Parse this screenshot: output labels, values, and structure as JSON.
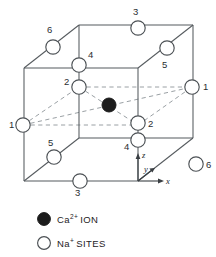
{
  "figure": {
    "colors": {
      "edge": "#555a5e",
      "hidden_edge": "#9aa0a4",
      "site_fill": "#ffffff",
      "site_stroke": "#4c5155",
      "ion_fill": "#1c1c1c",
      "background": "#ffffff"
    }
  },
  "nodes": [
    {
      "id": "site-6-top",
      "label": "6",
      "cx": 53,
      "cy": 47,
      "r": 7.2,
      "label_x": 47,
      "label_y": 33
    },
    {
      "id": "site-3-top",
      "label": "3",
      "cx": 138,
      "cy": 28,
      "r": 7.2,
      "label_x": 133,
      "label_y": 15
    },
    {
      "id": "site-5-top",
      "label": "5",
      "cx": 167,
      "cy": 48,
      "r": 7.2,
      "label_x": 162,
      "label_y": 68
    },
    {
      "id": "site-4-upper",
      "label": "4",
      "cx": 79,
      "cy": 65,
      "r": 7.2,
      "label_x": 88,
      "label_y": 58
    },
    {
      "id": "site-2-upper",
      "label": "2",
      "cx": 79,
      "cy": 87,
      "r": 7.2,
      "label_x": 64,
      "label_y": 85
    },
    {
      "id": "site-1-left",
      "label": "1",
      "cx": 23,
      "cy": 125,
      "r": 7.2,
      "label_x": 9,
      "label_y": 128
    },
    {
      "id": "site-1-right",
      "label": "1",
      "cx": 192,
      "cy": 87,
      "r": 7.2,
      "label_x": 203,
      "label_y": 90
    },
    {
      "id": "site-2-lower",
      "label": "2",
      "cx": 138,
      "cy": 123,
      "r": 7.2,
      "label_x": 148,
      "label_y": 127
    },
    {
      "id": "site-4-lower",
      "label": "4",
      "cx": 138,
      "cy": 140,
      "r": 7.2,
      "label_x": 124,
      "label_y": 150
    },
    {
      "id": "site-5-lower",
      "label": "5",
      "cx": 54,
      "cy": 157,
      "r": 7.2,
      "label_x": 48,
      "label_y": 146
    },
    {
      "id": "site-6-lower",
      "label": "6",
      "cx": 196,
      "cy": 164,
      "r": 7.2,
      "label_x": 206,
      "label_y": 168
    },
    {
      "id": "site-3-lower",
      "label": "3",
      "cx": 80,
      "cy": 181,
      "r": 7.2,
      "label_x": 75,
      "label_y": 196
    }
  ],
  "ion": {
    "id": "ca-ion",
    "cx": 109,
    "cy": 105,
    "r": 7.0
  },
  "axes": {
    "origin_x": 138,
    "origin_y": 181,
    "labels": [
      {
        "id": "axis-z",
        "text": "z",
        "x": 142,
        "y": 158
      },
      {
        "id": "axis-y",
        "text": "y",
        "x": 144,
        "y": 172
      },
      {
        "id": "axis-x",
        "text": "x",
        "x": 166,
        "y": 184
      }
    ]
  },
  "legend": {
    "items": [
      {
        "id": "legend-ca-ion",
        "marker": "filled-circle",
        "element": "Ca",
        "charge": "2+",
        "suffix": "ION",
        "marker_cx": 44,
        "marker_cy": 219,
        "text_x": 57,
        "text_y": 223
      },
      {
        "id": "legend-na-sites",
        "marker": "open-circle",
        "element": "Na",
        "charge": "+",
        "suffix": "SITES",
        "marker_cx": 44,
        "marker_cy": 243,
        "text_x": 57,
        "text_y": 247
      }
    ]
  },
  "chart_data": {
    "type": "diagram",
    "cube_vertices": {
      "front_top_left": [
        24,
        68
      ],
      "front_top_right": [
        138,
        68
      ],
      "front_bottom_left": [
        24,
        181
      ],
      "front_bottom_right": [
        138,
        181
      ],
      "back_top_left": [
        79,
        25
      ],
      "back_top_right": [
        193,
        25
      ],
      "back_bottom_left": [
        79,
        138
      ],
      "back_bottom_right": [
        193,
        138
      ]
    },
    "site_labels": [
      "1",
      "1",
      "2",
      "2",
      "3",
      "3",
      "4",
      "4",
      "5",
      "5",
      "6",
      "6"
    ],
    "ion_position": [
      109,
      105
    ],
    "legend_entries": [
      "Ca2+ ION",
      "Na+ SITES"
    ]
  }
}
